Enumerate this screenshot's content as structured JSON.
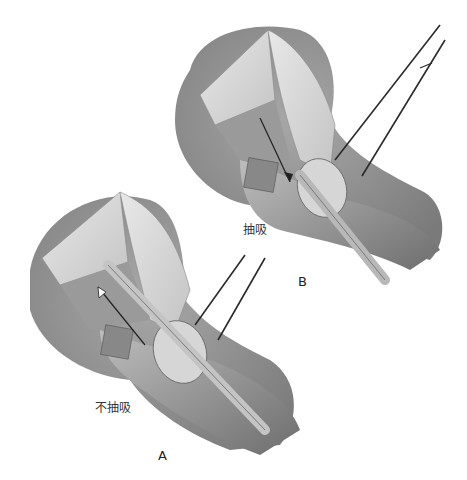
{
  "figure": {
    "panels": [
      {
        "id": "A",
        "letter": "A",
        "caption": "不抽吸"
      },
      {
        "id": "B",
        "letter": "B",
        "caption": "抽吸"
      }
    ]
  },
  "colors": {
    "background": "#ffffff",
    "skin_shadow": "#8c8c8c",
    "tissue": "#c9c9c9",
    "bone": "#dedede",
    "instrument": "#2a2a2a"
  }
}
